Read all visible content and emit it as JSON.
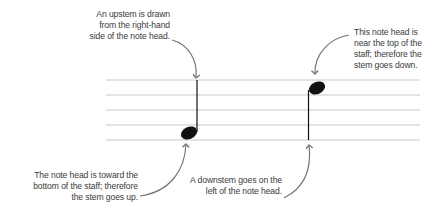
{
  "diagram": {
    "staff": {
      "line_count": 5,
      "x_start": 106,
      "x_end": 420,
      "line_y": [
        80,
        95,
        110,
        125,
        140
      ],
      "line_color": "#c8c8c8"
    },
    "notes": [
      {
        "name": "low-note",
        "head_cx": 189,
        "head_cy": 133,
        "stem": "up",
        "stem_side": "right"
      },
      {
        "name": "high-note",
        "head_cx": 317,
        "head_cy": 88,
        "stem": "down",
        "stem_side": "left"
      }
    ],
    "colors": {
      "note": "#111111",
      "arrow": "#777777",
      "text": "#3a3a3a"
    },
    "annotations": {
      "upstem": {
        "lines": [
          "An upstem is drawn",
          "from the right-hand",
          "side of the note head."
        ]
      },
      "top_note": {
        "lines": [
          "This note head is",
          "near the top of the",
          "staff; therefore the",
          "stem goes down."
        ]
      },
      "bottom_note": {
        "lines": [
          "The note head is toward the",
          "bottom of the staff; therefore",
          "the stem goes up."
        ]
      },
      "downstem": {
        "lines": [
          "A downstem goes on the",
          "left of the note head."
        ]
      }
    }
  }
}
